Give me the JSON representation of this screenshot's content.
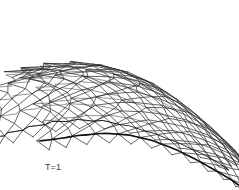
{
  "figure": {
    "kind": "stent-mesh-deformation-plot",
    "background_color": "#ffffff",
    "line_color": "#2e2e2e",
    "edge_color": "#111111",
    "width": 239,
    "height": 190
  },
  "annotations": {
    "time_label": "T=1",
    "pressure_label": "P=96",
    "text_color": "#3a3a3a",
    "x": 45,
    "y": 140
  },
  "chart_data": {
    "type": "line",
    "title": "",
    "subtitle": "",
    "xlabel": "",
    "ylabel": "",
    "grid": false,
    "legend": "none",
    "annotations": [
      "T=1",
      "P=96"
    ],
    "mesh": {
      "rings": 22,
      "cells_per_ring": 11,
      "cell_shape": "diamond",
      "ring_param_start": 0.0,
      "ring_param_end": 1.0,
      "axis_curve": {
        "comment": "center axis of the tube in screen coords, cubic-ish sample points",
        "x": [
          14,
          30,
          52,
          78,
          104,
          130,
          156,
          180,
          202,
          222,
          236
        ],
        "y": [
          136,
          133,
          128,
          124,
          124,
          128,
          136,
          146,
          157,
          168,
          178
        ]
      },
      "radius_profile": [
        74,
        76,
        77,
        76,
        72,
        66,
        58,
        50,
        42,
        34,
        26
      ],
      "tilt_profile_deg": [
        2,
        4,
        7,
        11,
        16,
        22,
        28,
        34,
        40,
        46,
        52
      ],
      "squeeze_profile": [
        0.3,
        0.32,
        0.36,
        0.42,
        0.5,
        0.58,
        0.66,
        0.74,
        0.8,
        0.86,
        0.92
      ],
      "crest_amplitude": [
        9,
        9,
        8.5,
        8,
        7,
        6,
        5,
        4.2,
        3.4,
        2.8,
        2.2
      ]
    },
    "series": [
      {
        "name": "longitudinal-struts",
        "count": 22,
        "stroke": "#2e2e2e",
        "width": 0.8
      },
      {
        "name": "helical-struts-cw",
        "count": 22,
        "stroke": "#2e2e2e",
        "width": 0.8
      },
      {
        "name": "helical-struts-ccw",
        "count": 22,
        "stroke": "#2e2e2e",
        "width": 0.8
      },
      {
        "name": "lower-boundary-arc",
        "count": 1,
        "stroke": "#111111",
        "width": 1.6
      }
    ]
  }
}
